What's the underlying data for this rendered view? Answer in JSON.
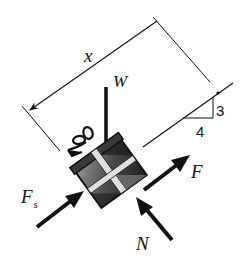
{
  "diagram": {
    "type": "free-body-diagram",
    "labels": {
      "distance": "x",
      "weight": "W",
      "applied_force": "F",
      "friction_force_main": "F",
      "friction_force_sub": "s",
      "normal_force": "N",
      "slope_rise": "3",
      "slope_run": "4"
    },
    "slope": {
      "rise": 3,
      "run": 4
    },
    "colors": {
      "ink": "#111111",
      "box_dark": "#2a2a2a",
      "box_mid": "#6e6e6e",
      "box_light": "#bdbdbd",
      "ribbon": "#e8e8e8",
      "background": "#ffffff"
    }
  }
}
